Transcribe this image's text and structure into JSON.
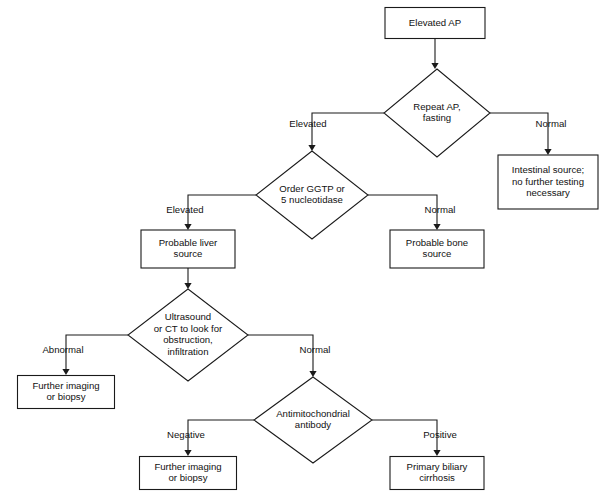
{
  "diagram": {
    "type": "flowchart",
    "background_color": "#ffffff",
    "line_color": "#1a1a1a",
    "text_color": "#111111",
    "canvas": {
      "width": 605,
      "height": 495
    }
  },
  "nodes": [
    {
      "id": "elevated-ap",
      "kind": "process",
      "lines": [
        "Elevated AP"
      ],
      "cx": 435,
      "cy": 23,
      "w": 100,
      "h": 31
    },
    {
      "id": "repeat-ap-fasting",
      "kind": "decision",
      "lines": [
        "Repeat AP,",
        "fasting"
      ],
      "cx": 437,
      "cy": 113,
      "w": 106,
      "h": 88
    },
    {
      "id": "intestinal-source",
      "kind": "process",
      "lines": [
        "Intestinal source;",
        "no further testing",
        "necessary"
      ],
      "cx": 548,
      "cy": 182,
      "w": 100,
      "h": 54
    },
    {
      "id": "order-ggtp",
      "kind": "decision",
      "lines": [
        "Order GGTP or",
        "5 nucleotidase"
      ],
      "cx": 312,
      "cy": 195,
      "w": 112,
      "h": 88
    },
    {
      "id": "probable-liver-source",
      "kind": "process",
      "lines": [
        "Probable liver",
        "source"
      ],
      "cx": 188,
      "cy": 249,
      "w": 94,
      "h": 38
    },
    {
      "id": "probable-bone-source",
      "kind": "process",
      "lines": [
        "Probable bone",
        "source"
      ],
      "cx": 437,
      "cy": 249,
      "w": 94,
      "h": 38
    },
    {
      "id": "ultrasound-ct",
      "kind": "decision",
      "lines": [
        "Ultrasound",
        "or CT to look for",
        "obstruction,",
        "infiltration"
      ],
      "cx": 188,
      "cy": 335,
      "w": 120,
      "h": 92
    },
    {
      "id": "further-imaging-abnormal",
      "kind": "process",
      "lines": [
        "Further imaging",
        "or biopsy"
      ],
      "cx": 66,
      "cy": 392,
      "w": 97,
      "h": 33
    },
    {
      "id": "antimitochondrial-antibody",
      "kind": "decision",
      "lines": [
        "Antimitochondrial",
        "antibody"
      ],
      "cx": 313,
      "cy": 420,
      "w": 118,
      "h": 86
    },
    {
      "id": "further-imaging-negative",
      "kind": "process",
      "lines": [
        "Further imaging",
        "or biopsy"
      ],
      "cx": 188,
      "cy": 473,
      "w": 97,
      "h": 33
    },
    {
      "id": "primary-biliary-cirrhosis",
      "kind": "process",
      "lines": [
        "Primary biliary",
        "cirrhosis"
      ],
      "cx": 437,
      "cy": 473,
      "w": 94,
      "h": 33
    }
  ],
  "edges": [
    {
      "id": "edge-elevated-ap-to-repeat",
      "from": "elevated-ap",
      "to": "repeat-ap-fasting",
      "label": "",
      "points": [
        [
          435,
          39
        ],
        [
          435,
          64
        ]
      ],
      "arrow": {
        "x": 435,
        "y": 69,
        "dir": "down"
      }
    },
    {
      "id": "edge-repeat-normal",
      "from": "repeat-ap-fasting",
      "to": "intestinal-source",
      "label": "Normal",
      "label_x": 551,
      "label_y": 124,
      "points": [
        [
          490,
          113
        ],
        [
          548,
          113
        ],
        [
          548,
          150
        ]
      ],
      "arrow": {
        "x": 548,
        "y": 155,
        "dir": "down"
      }
    },
    {
      "id": "edge-repeat-elevated",
      "from": "repeat-ap-fasting",
      "to": "order-ggtp",
      "label": "Elevated",
      "label_x": 308,
      "label_y": 124,
      "points": [
        [
          384,
          113
        ],
        [
          312,
          113
        ],
        [
          312,
          146
        ]
      ],
      "arrow": {
        "x": 312,
        "y": 151,
        "dir": "down"
      }
    },
    {
      "id": "edge-ggtp-normal",
      "from": "order-ggtp",
      "to": "probable-bone-source",
      "label": "Normal",
      "label_x": 440,
      "label_y": 210,
      "points": [
        [
          368,
          195
        ],
        [
          437,
          195
        ],
        [
          437,
          225
        ]
      ],
      "arrow": {
        "x": 437,
        "y": 230,
        "dir": "down"
      }
    },
    {
      "id": "edge-ggtp-elevated",
      "from": "order-ggtp",
      "to": "probable-liver-source",
      "label": "Elevated",
      "label_x": 185,
      "label_y": 210,
      "points": [
        [
          256,
          195
        ],
        [
          188,
          195
        ],
        [
          188,
          225
        ]
      ],
      "arrow": {
        "x": 188,
        "y": 230,
        "dir": "down"
      }
    },
    {
      "id": "edge-liver-to-ultrasound",
      "from": "probable-liver-source",
      "to": "ultrasound-ct",
      "label": "",
      "points": [
        [
          188,
          268
        ],
        [
          188,
          284
        ]
      ],
      "arrow": {
        "x": 188,
        "y": 289,
        "dir": "down"
      }
    },
    {
      "id": "edge-ultrasound-abnormal",
      "from": "ultrasound-ct",
      "to": "further-imaging-abnormal",
      "label": "Abnormal",
      "label_x": 63,
      "label_y": 350,
      "points": [
        [
          128,
          335
        ],
        [
          66,
          335
        ],
        [
          66,
          370
        ]
      ],
      "arrow": {
        "x": 66,
        "y": 375,
        "dir": "down"
      }
    },
    {
      "id": "edge-ultrasound-normal",
      "from": "ultrasound-ct",
      "to": "antimitochondrial-antibody",
      "label": "Normal",
      "label_x": 315,
      "label_y": 350,
      "points": [
        [
          248,
          335
        ],
        [
          313,
          335
        ],
        [
          313,
          372
        ]
      ],
      "arrow": {
        "x": 313,
        "y": 377,
        "dir": "down"
      }
    },
    {
      "id": "edge-antibody-negative",
      "from": "antimitochondrial-antibody",
      "to": "further-imaging-negative",
      "label": "Negative",
      "label_x": 186,
      "label_y": 435,
      "points": [
        [
          254,
          420
        ],
        [
          188,
          420
        ],
        [
          188,
          451
        ]
      ],
      "arrow": {
        "x": 188,
        "y": 456,
        "dir": "down"
      }
    },
    {
      "id": "edge-antibody-positive",
      "from": "antimitochondrial-antibody",
      "to": "primary-biliary-cirrhosis",
      "label": "Positive",
      "label_x": 440,
      "label_y": 435,
      "points": [
        [
          372,
          420
        ],
        [
          437,
          420
        ],
        [
          437,
          451
        ]
      ],
      "arrow": {
        "x": 437,
        "y": 456,
        "dir": "down"
      }
    }
  ]
}
